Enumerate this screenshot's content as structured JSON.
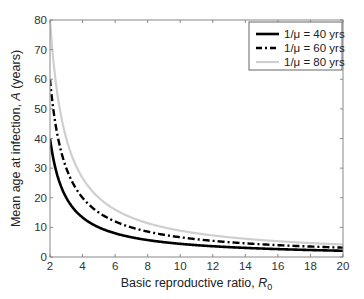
{
  "chart_data": {
    "type": "line",
    "title": "",
    "xlabel": "Basic reproductive ratio, R0",
    "xlabel_main": "Basic reproductive ratio, ",
    "xlabel_var": "R",
    "xlabel_sub": "0",
    "ylabel": "Mean age at infection, A (years)",
    "ylabel_pre": "Mean age at infection, ",
    "ylabel_var": "A",
    "ylabel_post": " (years)",
    "xlim": [
      2,
      20
    ],
    "ylim": [
      0,
      80
    ],
    "xticks": [
      2,
      4,
      6,
      8,
      10,
      12,
      14,
      16,
      18,
      20
    ],
    "yticks": [
      0,
      10,
      20,
      30,
      40,
      50,
      60,
      70,
      80
    ],
    "grid": false,
    "legend_position": "upper right",
    "x": [
      2,
      2.5,
      3,
      3.5,
      4,
      5,
      6,
      7,
      8,
      9,
      10,
      12,
      14,
      16,
      18,
      20
    ],
    "series": [
      {
        "name": "1/μ = 40 yrs",
        "style": "solid",
        "color": "#000000",
        "width": 2.6,
        "values": [
          40,
          26.7,
          20,
          16,
          13.3,
          10,
          8,
          6.7,
          5.7,
          5,
          4.4,
          3.6,
          3.1,
          2.7,
          2.4,
          2.1
        ]
      },
      {
        "name": "1/μ = 60 yrs",
        "style": "dashdot",
        "color": "#000000",
        "width": 2.4,
        "values": [
          60,
          40,
          30,
          24,
          20,
          15,
          12,
          10,
          8.6,
          7.5,
          6.7,
          5.5,
          4.6,
          4,
          3.5,
          3.2
        ]
      },
      {
        "name": "1/μ = 80 yrs",
        "style": "solid",
        "color": "#cfcfcf",
        "width": 2.2,
        "values": [
          80,
          53.3,
          40,
          32,
          26.7,
          20,
          16,
          13.3,
          11.4,
          10,
          8.9,
          7.3,
          6.2,
          5.3,
          4.7,
          4.2
        ]
      }
    ]
  }
}
